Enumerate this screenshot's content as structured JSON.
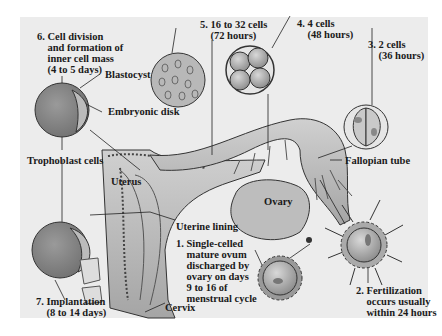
{
  "diagram": {
    "background": "#ececec",
    "structure_fill": "#b5b5b5",
    "cell_fill": "#8f8f8f",
    "line_color": "#222222",
    "stages": [
      {
        "id": "stage-1",
        "number": "1.",
        "text": "Single-celled\nmature ovum\ndischarged by\novary on days\n9 to 16 of\nmenstrual cycle"
      },
      {
        "id": "stage-2",
        "number": "2.",
        "text": "Fertilization\noccurs usually\nwithin 24 hours"
      },
      {
        "id": "stage-3",
        "number": "3.",
        "text": "2 cells\n(36 hours)"
      },
      {
        "id": "stage-4",
        "number": "4.",
        "text": "4 cells\n(48 hours)"
      },
      {
        "id": "stage-5",
        "number": "5.",
        "text": "16 to 32 cells\n(72 hours)"
      },
      {
        "id": "stage-6",
        "number": "6.",
        "text": "Cell division\nand formation of\ninner cell mass\n(4 to 5 days)"
      },
      {
        "id": "stage-7",
        "number": "7.",
        "text": "Implantation\n(8 to 14 days)"
      }
    ],
    "structures": {
      "blastocyst": "Blastocyst",
      "embryonic_disk": "Embryonic disk",
      "trophoblast": "Trophoblast cells",
      "uterus": "Uterus",
      "uterine_lining": "Uterine lining",
      "ovary": "Ovary",
      "fallopian_tube": "Fallopian tube",
      "cervix": "Cervix"
    }
  },
  "labels": {
    "s6": "6. Cell division\n    and formation of\n    inner cell mass\n    (4 to 5 days)",
    "s5": "5. 16 to 32 cells\n    (72 hours)",
    "s4": "4. 4 cells\n    (48 hours)",
    "s3": "3. 2 cells\n    (36 hours)",
    "s1": "1. Single-celled\n    mature ovum\n    discharged by\n    ovary on days\n    9 to 16 of\n    menstrual cycle",
    "s2": "2. Fertilization\n    occurs usually\n    within 24 hours",
    "s7": "7. Implantation\n    (8 to 14 days)"
  }
}
